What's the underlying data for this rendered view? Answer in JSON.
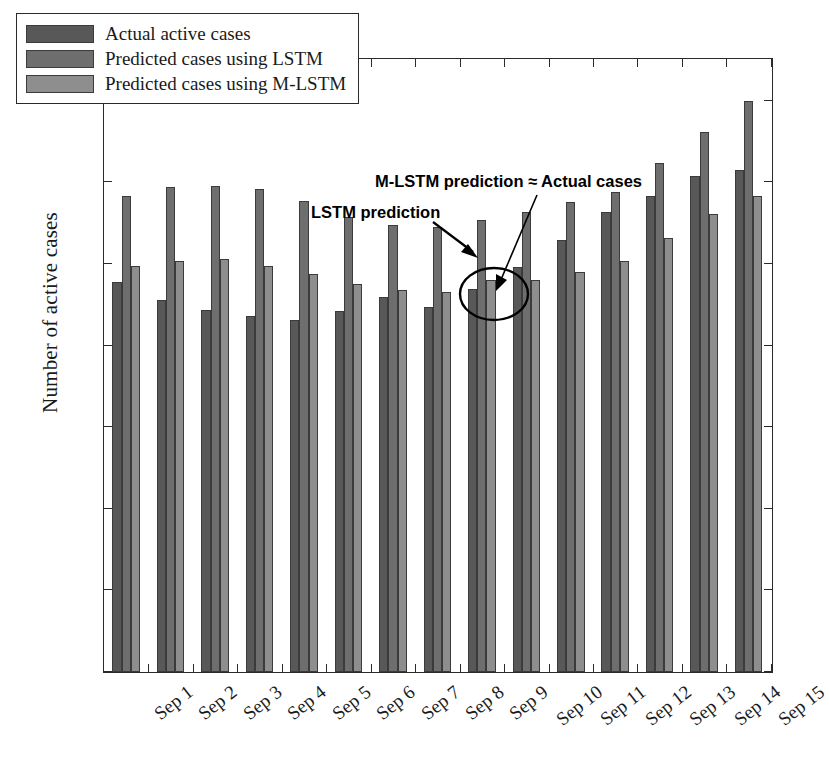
{
  "chart_data": {
    "type": "bar",
    "title": "",
    "xlabel": "",
    "ylabel": "Number of active cases",
    "y_exponent_label": "× 10",
    "y_exponent_power": "4",
    "y_scale": 10000,
    "ylim": [
      0,
      3.75
    ],
    "yticks": [
      0,
      0.5,
      1,
      1.5,
      2,
      2.5,
      3,
      3.5
    ],
    "ytick_labels": [
      "0",
      "0.5",
      "1",
      "1.5",
      "2",
      "2.5",
      "3",
      "3.5"
    ],
    "grid": false,
    "legend_position": "top-left",
    "categories": [
      "Sep 1",
      "Sep 2",
      "Sep 3",
      "Sep 4",
      "Sep 5",
      "Sep 6",
      "Sep 7",
      "Sep 8",
      "Sep 9",
      "Sep 10",
      "Sep 11",
      "Sep 12",
      "Sep 13",
      "Sep 14",
      "Sep 15"
    ],
    "series": [
      {
        "name": "Actual active cases",
        "color": "#585858",
        "values": [
          2.39,
          2.28,
          2.22,
          2.18,
          2.16,
          2.21,
          2.3,
          2.24,
          2.35,
          2.48,
          2.65,
          2.82,
          2.92,
          3.04,
          3.08
        ]
      },
      {
        "name": "Predicted cases using LSTM",
        "color": "#6e6e6e",
        "values": [
          2.92,
          2.97,
          2.98,
          2.96,
          2.89,
          2.79,
          2.74,
          2.73,
          2.77,
          2.82,
          2.88,
          2.94,
          3.12,
          3.31,
          3.5
        ]
      },
      {
        "name": "Predicted cases using M-LSTM",
        "color": "#8e8e8e",
        "values": [
          2.49,
          2.52,
          2.53,
          2.49,
          2.44,
          2.38,
          2.34,
          2.33,
          2.4,
          2.4,
          2.45,
          2.52,
          2.66,
          2.81,
          2.92
        ]
      }
    ],
    "annotations": [
      {
        "id": "lstm",
        "text": "LSTM prediction",
        "points_to": "Sep 9 LSTM bar top"
      },
      {
        "id": "mlstm",
        "text": "M-LSTM prediction ≈ Actual cases",
        "points_to": "Sep 9 actual/M-LSTM bars"
      }
    ],
    "highlight": {
      "shape": "ellipse",
      "target": "Sep 9 actual and M-LSTM bars"
    }
  },
  "legend": {
    "items": [
      {
        "label": "Actual active cases",
        "color": "#585858"
      },
      {
        "label": "Predicted cases using LSTM",
        "color": "#6e6e6e"
      },
      {
        "label": "Predicted cases using M-LSTM",
        "color": "#8e8e8e"
      }
    ]
  }
}
